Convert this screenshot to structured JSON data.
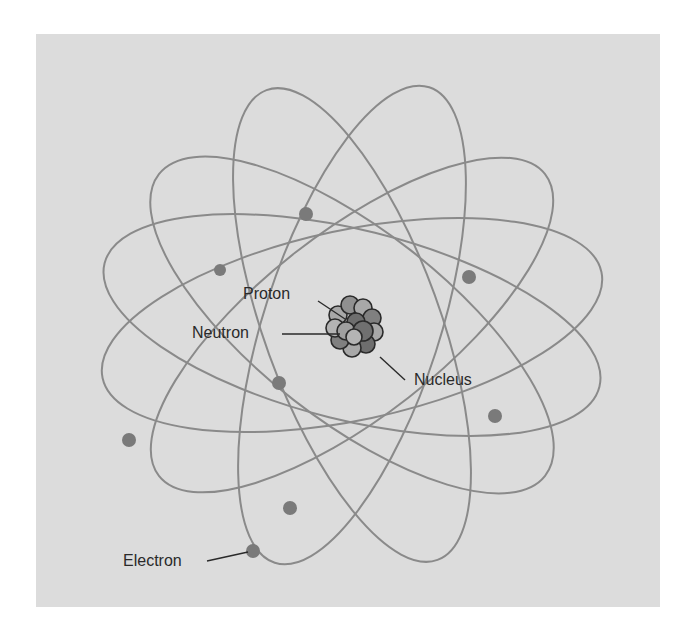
{
  "diagram": {
    "labels": {
      "proton": "Proton",
      "neutron": "Neutron",
      "nucleus": "Nucleus",
      "electron": "Electron"
    },
    "colors": {
      "background": "#dcdcdc",
      "orbit": "#8a8a8a",
      "electron": "#7a7a7a",
      "proton": "#6e6e6e",
      "neutron": "#a8a8a8",
      "label": "#2a2a2a"
    },
    "nucleus_center": [
      352,
      325
    ],
    "orbit_count": 6,
    "electron_count": 8
  }
}
